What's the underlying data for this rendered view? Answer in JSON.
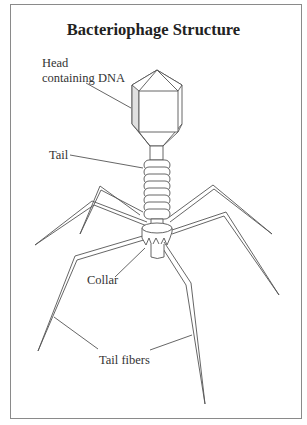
{
  "title": "Bacteriophage Structure",
  "labels": {
    "head_line1": "Head",
    "head_line2": "containing DNA",
    "tail": "Tail",
    "collar": "Collar",
    "tail_fibers": "Tail fibers"
  },
  "colors": {
    "line": "#555555",
    "text": "#333333",
    "frame": "#8a8a8a",
    "shade": "#d9d9d9"
  }
}
